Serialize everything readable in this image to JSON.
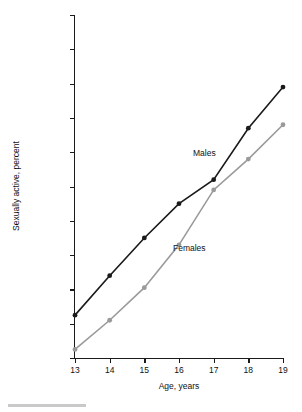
{
  "chart_data": {
    "type": "line",
    "title": "",
    "xlabel": "Age, years",
    "ylabel": "Sexually active, percent",
    "x": [
      13,
      14,
      15,
      16,
      17,
      18,
      19
    ],
    "xlim": [
      13,
      19
    ],
    "ylim": [
      0,
      100
    ],
    "xticks": [
      "13",
      "14",
      "15",
      "16",
      "17",
      "18",
      "19"
    ],
    "yticks": [
      "0",
      "10",
      "20",
      "30",
      "40",
      "50",
      "60",
      "70",
      "80",
      "90",
      "100"
    ],
    "grid": false,
    "legend_position": "inline-annotation",
    "series": [
      {
        "name": "Males",
        "color": "#1a1a1a",
        "values": [
          12.5,
          24,
          35,
          45,
          52,
          67,
          79
        ]
      },
      {
        "name": "Females",
        "color": "#9a9a9a",
        "values": [
          2.5,
          11,
          20.5,
          33,
          49,
          58,
          68
        ]
      }
    ],
    "annotations": [
      {
        "text": "Males",
        "series": "Males"
      },
      {
        "text": "Females",
        "series": "Females"
      }
    ]
  }
}
